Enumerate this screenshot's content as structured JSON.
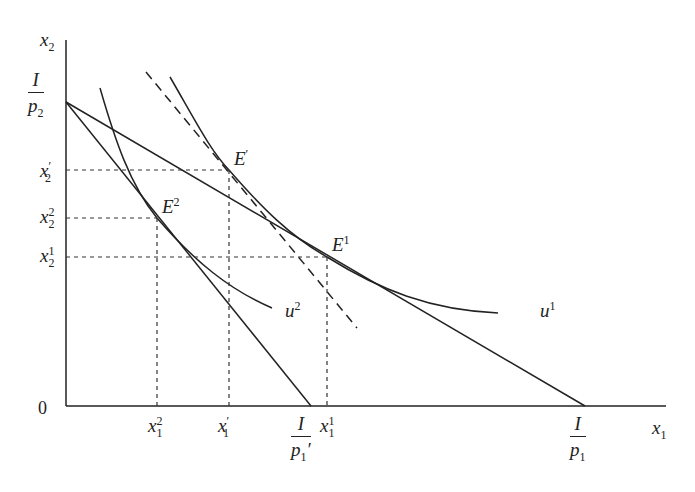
{
  "caption": {
    "text": "",
    "note_visible": "cropped caption strip at top edge, illegible"
  },
  "axes": {
    "y_label": {
      "base": "x",
      "sub": "2"
    },
    "x_label": {
      "base": "x",
      "sub": "1"
    },
    "origin": "0"
  },
  "y_ticks": [
    {
      "id": "I_p2",
      "num": "I",
      "den_base": "p",
      "den_sub": "2"
    },
    {
      "id": "x2_prime",
      "base": "x",
      "prime": "′",
      "sub": "2"
    },
    {
      "id": "x2_2",
      "base": "x",
      "sup": "2",
      "sub": "2"
    },
    {
      "id": "x2_1",
      "base": "x",
      "sup": "1",
      "sub": "2"
    }
  ],
  "x_ticks": [
    {
      "id": "x1_2",
      "base": "x",
      "sup": "2",
      "sub": "1"
    },
    {
      "id": "x1_prime",
      "base": "x",
      "prime": "′",
      "sub": "1"
    },
    {
      "id": "I_p1_prime",
      "num": "I",
      "den_base": "p",
      "den_sub": "1",
      "den_prime": "′"
    },
    {
      "id": "x1_1",
      "base": "x",
      "sup": "1",
      "sub": "1"
    },
    {
      "id": "I_p1",
      "num": "I",
      "den_base": "p",
      "den_sub": "1"
    }
  ],
  "points": [
    {
      "id": "E_prime",
      "base": "E",
      "sup": "′"
    },
    {
      "id": "E2",
      "base": "E",
      "sup": "2"
    },
    {
      "id": "E1",
      "base": "E",
      "sup": "1"
    }
  ],
  "curves": [
    {
      "id": "u1",
      "base": "u",
      "sup": "1"
    },
    {
      "id": "u2",
      "base": "u",
      "sup": "2"
    }
  ],
  "lines": {
    "budget_original": "I/p2 to I/p1",
    "budget_new": "I/p2 to I/p1′",
    "compensated_budget": "dashed, tangent to u1 at E′"
  },
  "colors": {
    "ink": "#222222",
    "background": "#ffffff"
  }
}
